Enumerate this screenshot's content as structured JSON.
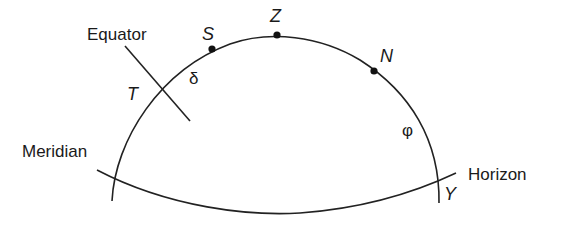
{
  "diagram": {
    "labels": {
      "equator": "Equator",
      "meridian": "Meridian",
      "horizon": "Horizon",
      "point_s": "S",
      "point_z": "Z",
      "point_n": "N",
      "point_t": "T",
      "point_y": "Y",
      "angle_delta": "δ",
      "angle_phi": "φ"
    },
    "colors": {
      "line": "#222222",
      "text": "#1a1a1a",
      "background": "#ffffff"
    }
  }
}
